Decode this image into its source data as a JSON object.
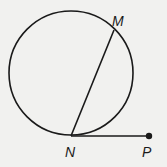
{
  "diagram": {
    "type": "circle-chord-tangent",
    "colors": {
      "stroke": "#1a1a1a",
      "background": "#f1f1ef"
    },
    "circle": {
      "cx": 71,
      "cy": 73,
      "r": 62
    },
    "points": [
      {
        "id": "M",
        "label": "M",
        "x": 114,
        "y": 30
      },
      {
        "id": "N",
        "label": "N",
        "x": 71,
        "y": 136
      },
      {
        "id": "P",
        "label": "P",
        "x": 149,
        "y": 136
      }
    ],
    "segments": [
      {
        "from": "N",
        "to": "M",
        "kind": "chord"
      },
      {
        "from": "N",
        "to": "P",
        "kind": "tangent-ray"
      }
    ]
  }
}
